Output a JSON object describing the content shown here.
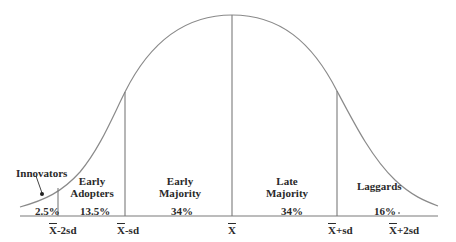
{
  "diagram": {
    "type": "bell-curve",
    "segments": [
      {
        "name": "Innovators",
        "label": "Innovators",
        "percent": "2.5%"
      },
      {
        "name": "Early Adopters",
        "label_line1": "Early",
        "label_line2": "Adopters",
        "percent": "13.5%"
      },
      {
        "name": "Early Majority",
        "label_line1": "Early",
        "label_line2": "Majority",
        "percent": "34%"
      },
      {
        "name": "Late Majority",
        "label_line1": "Late",
        "label_line2": "Majority",
        "percent": "34%"
      },
      {
        "name": "Laggards",
        "label": "Laggards",
        "percent": "16%"
      }
    ],
    "axis_ticks": [
      {
        "xbar": "X",
        "suffix": "-2sd"
      },
      {
        "xbar": "X",
        "suffix": "-sd"
      },
      {
        "xbar": "X",
        "suffix": ""
      },
      {
        "xbar": "X",
        "suffix": "+sd"
      },
      {
        "xbar": "X",
        "suffix": "+2sd"
      }
    ],
    "colors": {
      "line": "#7a7a7a",
      "curve": "#8a8a8a",
      "text": "#2a2a2a"
    }
  }
}
